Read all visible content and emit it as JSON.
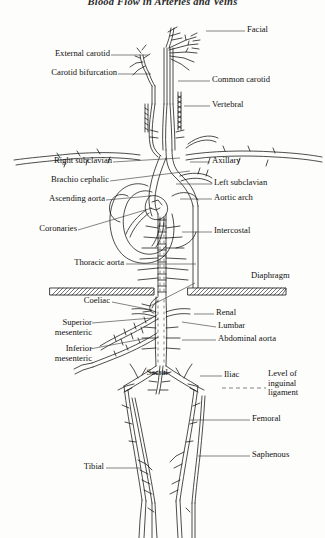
{
  "figure": {
    "title": "Blood Flow in Arteries and Veins",
    "ink_color": "#111111",
    "background_color": "#fdfdfb"
  },
  "labels": {
    "facial": "Facial",
    "external_carotid": "External carotid",
    "carotid_bifurcation": "Carotid bifurcation",
    "common_carotid": "Common carotid",
    "vertebral": "Vertebral",
    "right_subclavian": "Right subclavian",
    "brachio_cephalic": "Brachio cephalic",
    "ascending_aorta": "Ascending aorta",
    "coronaries": "Coronaries",
    "axillary": "Axillary",
    "left_subclavian": "Left subclavian",
    "aortic_arch": "Aortic arch",
    "intercostal": "Intercostal",
    "thoracic_aorta": "Thoracic aorta",
    "diaphragm": "Diaphragm",
    "coeliac": "Coeliac",
    "superior_mesenteric": "Superior mesenteric",
    "inferior_mesenteric": "Inferior mesenteric",
    "renal": "Renal",
    "lumbar": "Lumbar",
    "abdominal_aorta": "Abdominal aorta",
    "sacral": "Sacral",
    "iliac": "Iliac",
    "level_of_inguinal_ligament": "Level of inguinal ligament",
    "femoral": "Femoral",
    "saphenous": "Saphenous",
    "tibial": "Tibial"
  }
}
